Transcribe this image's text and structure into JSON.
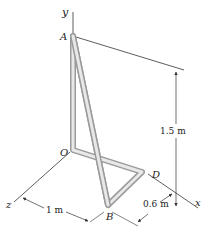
{
  "figure": {
    "points": {
      "A": "A",
      "B": "B",
      "D": "D",
      "O": "O"
    },
    "axes": {
      "x": "x",
      "y": "y",
      "z": "z"
    },
    "dimensions": {
      "height": "1.5 m",
      "z_length": "1 m",
      "x_offset": "0.6 m"
    },
    "colors": {
      "rod_outer": "#9a9a9a",
      "rod_inner": "#e8e8e8",
      "line": "#333333"
    }
  }
}
